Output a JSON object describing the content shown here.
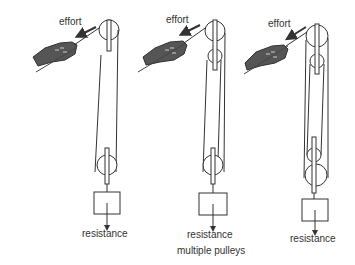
{
  "diagram": {
    "caption": "multiple pulleys",
    "systems": [
      {
        "id": "single-movable",
        "effort_label": "effort",
        "resistance_label": "resistance",
        "fixed_pulleys": 1,
        "movable_pulleys": 1,
        "supporting_ropes": 2
      },
      {
        "id": "double",
        "effort_label": "effort",
        "resistance_label": "resistance",
        "fixed_pulleys": 2,
        "movable_pulleys": 1,
        "supporting_ropes": 3
      },
      {
        "id": "triple",
        "effort_label": "effort",
        "resistance_label": "resistance",
        "fixed_pulleys": 2,
        "movable_pulleys": 2,
        "supporting_ropes": 4
      }
    ],
    "colors": {
      "line": "#333333",
      "hand": "#555555",
      "background": "#ffffff"
    }
  }
}
